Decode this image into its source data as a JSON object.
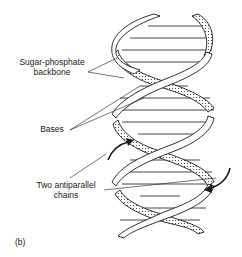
{
  "figure": {
    "panel_label": "(b)",
    "labels": {
      "backbone_line1": "Sugar-phosphate",
      "backbone_line2": "backbone",
      "bases": "Bases",
      "chains_line1": "Two antiparallel",
      "chains_line2": "chains"
    },
    "colors": {
      "stroke": "#1a1a1a",
      "background": "#ffffff",
      "stipple": "#333333"
    }
  }
}
